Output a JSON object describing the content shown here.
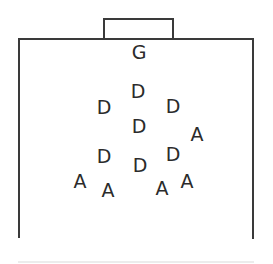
{
  "diagram": {
    "type": "formation-sketch",
    "colors": {
      "line": "#3a3a3a",
      "text": "#2b2b2b",
      "baseline": "#ececec",
      "background": "#ffffff"
    },
    "legend": {
      "G": "goalkeeper",
      "D": "defender",
      "A": "attacker"
    },
    "positions": [
      {
        "label": "G",
        "role": "goalkeeper",
        "x": 139,
        "y": 52
      },
      {
        "label": "D",
        "role": "defender",
        "x": 138,
        "y": 91
      },
      {
        "label": "D",
        "role": "defender",
        "x": 104,
        "y": 107
      },
      {
        "label": "D",
        "role": "defender",
        "x": 173,
        "y": 106
      },
      {
        "label": "D",
        "role": "defender",
        "x": 139,
        "y": 126
      },
      {
        "label": "A",
        "role": "attacker",
        "x": 197,
        "y": 134
      },
      {
        "label": "D",
        "role": "defender",
        "x": 104,
        "y": 156
      },
      {
        "label": "D",
        "role": "defender",
        "x": 140,
        "y": 165
      },
      {
        "label": "D",
        "role": "defender",
        "x": 173,
        "y": 154
      },
      {
        "label": "A",
        "role": "attacker",
        "x": 80,
        "y": 181
      },
      {
        "label": "A",
        "role": "attacker",
        "x": 108,
        "y": 190
      },
      {
        "label": "A",
        "role": "attacker",
        "x": 162,
        "y": 188
      },
      {
        "label": "A",
        "role": "attacker",
        "x": 187,
        "y": 181
      }
    ]
  }
}
